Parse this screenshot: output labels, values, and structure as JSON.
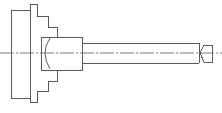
{
  "diagram": {
    "type": "mechanical-drawing",
    "colors": {
      "line": "#5a5a5a",
      "background": "#ffffff"
    },
    "parts": [
      {
        "name": "chuck-flange"
      },
      {
        "name": "stepped-chuck-body"
      },
      {
        "name": "collet-housing"
      },
      {
        "name": "mandrel-shaft"
      },
      {
        "name": "tailstock-center"
      },
      {
        "name": "centerline"
      }
    ]
  }
}
